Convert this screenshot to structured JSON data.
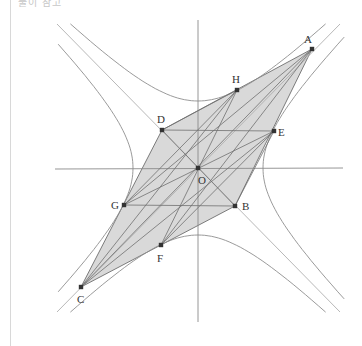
{
  "caption": "풀이 참고",
  "figure": {
    "origin": {
      "x": 198,
      "y": 168
    },
    "axes": {
      "x_axis": {
        "x1": 55,
        "y1": 169,
        "x2": 343,
        "y2": 168
      },
      "y_axis": {
        "x1": 198,
        "y1": 20,
        "x2": 198,
        "y2": 322
      }
    },
    "points": [
      {
        "name": "A",
        "x": 312,
        "y": 49,
        "lx": 304,
        "ly": 43
      },
      {
        "name": "H",
        "x": 237,
        "y": 90,
        "lx": 232,
        "ly": 83
      },
      {
        "name": "D",
        "x": 162,
        "y": 130,
        "lx": 157,
        "ly": 123
      },
      {
        "name": "E",
        "x": 274,
        "y": 131,
        "lx": 278,
        "ly": 136
      },
      {
        "name": "O",
        "x": 198,
        "y": 168,
        "lx": 198,
        "ly": 184
      },
      {
        "name": "B",
        "x": 235,
        "y": 206,
        "lx": 242,
        "ly": 210
      },
      {
        "name": "G",
        "x": 124,
        "y": 205,
        "lx": 111,
        "ly": 209
      },
      {
        "name": "F",
        "x": 161,
        "y": 245,
        "lx": 157,
        "ly": 262
      },
      {
        "name": "C",
        "x": 81,
        "y": 287,
        "lx": 77,
        "ly": 303
      }
    ],
    "shaded_region": [
      "A",
      "D",
      "C",
      "B"
    ],
    "segments": [
      [
        "A",
        "C"
      ],
      [
        "D",
        "B"
      ],
      [
        "H",
        "F"
      ],
      [
        "G",
        "E"
      ],
      [
        "D",
        "E"
      ],
      [
        "G",
        "B"
      ],
      [
        "H",
        "G"
      ],
      [
        "E",
        "F"
      ],
      [
        "A",
        "G"
      ],
      [
        "A",
        "F"
      ],
      [
        "C",
        "H"
      ],
      [
        "C",
        "E"
      ],
      [
        "H",
        "D"
      ],
      [
        "E",
        "B"
      ]
    ],
    "asymptotes": [
      {
        "x1": 57,
        "y1": 24,
        "x2": 340,
        "y2": 312
      },
      {
        "x1": 57,
        "y1": 312,
        "x2": 340,
        "y2": 24
      }
    ],
    "hyperbolas": {
      "vertical": {
        "cx": 198,
        "cy": 168,
        "a": 67
      },
      "horizontal": {
        "cx": 198,
        "cy": 168,
        "a": 65
      }
    },
    "colors": {
      "shade": "#d9d9d9",
      "axis": "#8a8a8a",
      "curve": "#8f8f8f",
      "point": "#333333"
    }
  }
}
